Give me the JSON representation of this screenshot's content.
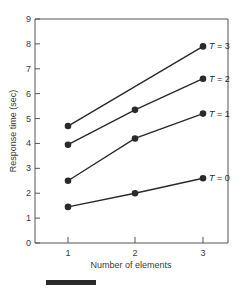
{
  "chart_data": {
    "type": "line",
    "title": "",
    "xlabel": "Number of elements",
    "ylabel": "Response time (sec)",
    "x": [
      1,
      2,
      3
    ],
    "xticks": [
      "1",
      "2",
      "3"
    ],
    "yticks": [
      "0",
      "1",
      "2",
      "3",
      "4",
      "5",
      "6",
      "7",
      "8",
      "9"
    ],
    "ylim": [
      0,
      9
    ],
    "grid": false,
    "legend_position": "inline-right",
    "series": [
      {
        "name": "T = 3",
        "values": [
          4.7,
          null,
          7.9
        ],
        "markers": [
          true,
          false,
          true
        ]
      },
      {
        "name": "T = 2",
        "values": [
          3.95,
          5.35,
          6.6
        ],
        "markers": [
          true,
          true,
          true
        ]
      },
      {
        "name": "T = 1",
        "values": [
          2.5,
          4.2,
          5.2
        ],
        "markers": [
          true,
          true,
          true
        ]
      },
      {
        "name": "T = 0",
        "values": [
          1.45,
          2.0,
          2.6
        ],
        "markers": [
          true,
          true,
          true
        ]
      }
    ],
    "line_color": "#2a2a2a"
  }
}
